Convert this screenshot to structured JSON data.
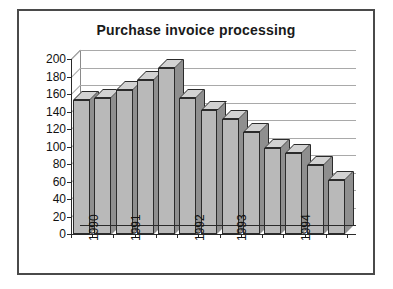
{
  "card": {
    "border_color": "#4a4a4a",
    "background": "#ffffff"
  },
  "chart_data": {
    "type": "bar",
    "title": "Purchase invoice processing",
    "xlabel": "",
    "ylabel": "",
    "ylim": [
      0,
      200
    ],
    "ytick_step": 20,
    "grid": true,
    "legend": "none",
    "style": "3d-column",
    "bar_fill": "#b9b9b9",
    "bar_top": "#d2d2d2",
    "bar_side": "#8f8f8f",
    "bar_outline": "#2b2b2b",
    "gridline_color": "#a9a9a9",
    "axis_color": "#2a2a2a",
    "categories": [
      "1990",
      "",
      "1991",
      "",
      "",
      "1992",
      "",
      "1993",
      "",
      "",
      "1994",
      "",
      ""
    ],
    "values": [
      153,
      156,
      165,
      176,
      190,
      156,
      142,
      131,
      117,
      98,
      93,
      79,
      62
    ],
    "yticks": [
      0,
      20,
      40,
      60,
      80,
      100,
      120,
      140,
      160,
      180,
      200
    ],
    "ytick_labels": [
      "0",
      "20",
      "40",
      "60",
      "80",
      "100",
      "120",
      "140",
      "160",
      "180",
      "200"
    ],
    "xtick_labels": [
      "1990",
      "1991",
      "1992",
      "1993",
      "1994"
    ],
    "xtick_bar_index": [
      0,
      2,
      5,
      7,
      10
    ]
  }
}
